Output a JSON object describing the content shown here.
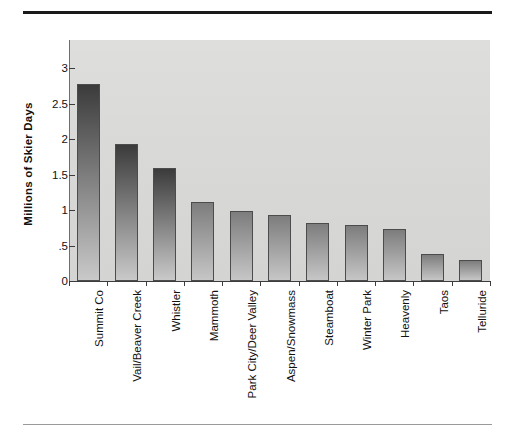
{
  "chart_data": {
    "type": "bar",
    "title": "",
    "xlabel": "",
    "ylabel": "Millions of Skier Days",
    "ylim": [
      0,
      3.25
    ],
    "yticks": [
      "0",
      ".5",
      "1",
      "1.5",
      "2",
      "2.5",
      "3"
    ],
    "ytick_values": [
      0,
      0.5,
      1,
      1.5,
      2,
      2.5,
      3
    ],
    "grid": false,
    "legend": "none",
    "categories": [
      "Summit Co",
      "Vail/Beaver Creek",
      "Whistler",
      "Mammoth",
      "Park City/Deer Valley",
      "Aspen/Snowmass",
      "Steamboat",
      "Winter Park",
      "Heavenly",
      "Taos",
      "Telluride"
    ],
    "values": [
      2.78,
      1.93,
      1.6,
      1.12,
      0.99,
      0.93,
      0.82,
      0.79,
      0.74,
      0.38,
      0.3
    ],
    "bar_colors": {
      "top": "#3b3b3b",
      "bottom": "#c9c9c9",
      "outline": "#4c4c4c"
    },
    "panel_background": "#d9d9d8"
  },
  "figure": {
    "top_rule_color": "#1a1a1a",
    "bottom_rule_color": "#9a9a9a"
  }
}
